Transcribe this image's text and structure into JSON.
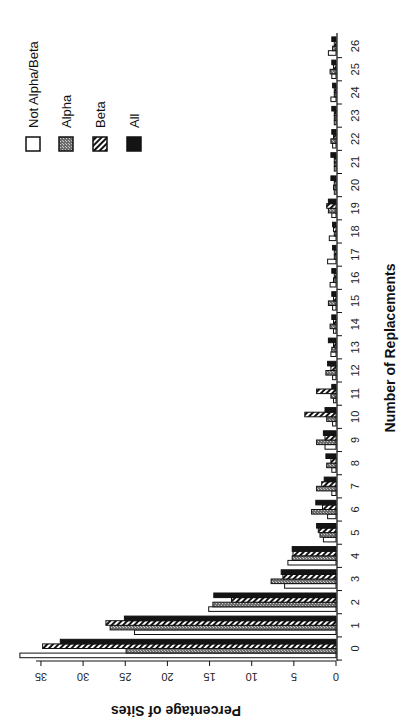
{
  "chart_data": {
    "type": "bar",
    "orientation": "rotated-90-ccw (bars grow leftward in image; x-axis categories run bottom-to-top)",
    "title": "",
    "xlabel": "Number of Replacements",
    "ylabel": "Percentage of Sites",
    "categories": [
      "0",
      "1",
      "2",
      "3",
      "4",
      "5",
      "6",
      "7",
      "8",
      "9",
      "10",
      "11",
      "12",
      "13",
      "14",
      "15",
      "16",
      "17",
      "18",
      "19",
      "20",
      "21",
      "22",
      "23",
      "24",
      "25",
      "26"
    ],
    "y_ticks": [
      0,
      5,
      10,
      15,
      20,
      25,
      30,
      35
    ],
    "ylim": [
      0,
      38
    ],
    "grid": false,
    "legend_position": "top-left (image coords)",
    "series": [
      {
        "name": "Not Alpha/Beta",
        "pattern": "white",
        "values": [
          37.5,
          23.9,
          15.1,
          6.1,
          5.7,
          1.5,
          1.0,
          0.5,
          0.5,
          1.3,
          0.4,
          0.3,
          0.4,
          0.6,
          0.3,
          0.4,
          0.7,
          1.0,
          0.8,
          0.5,
          0.2,
          0.2,
          0.4,
          0.2,
          0.6,
          0.5,
          0.9
        ]
      },
      {
        "name": "Alpha",
        "pattern": "gray",
        "values": [
          24.9,
          26.8,
          14.6,
          7.7,
          5.2,
          1.9,
          2.9,
          2.3,
          1.1,
          2.3,
          1.1,
          0.6,
          1.2,
          0.5,
          0.7,
          0.9,
          0.3,
          0.2,
          0.2,
          0.9,
          0.3,
          0.2,
          0.6,
          0.2,
          0.2,
          0.7,
          0.4
        ]
      },
      {
        "name": "Beta",
        "pattern": "hatched",
        "values": [
          34.8,
          27.3,
          12.4,
          6.3,
          5.1,
          2.1,
          1.6,
          1.7,
          0.6,
          1.3,
          3.7,
          2.3,
          0.6,
          0.3,
          0.3,
          0.3,
          0.2,
          0.2,
          0.3,
          1.1,
          0.2,
          0.2,
          0.3,
          0.2,
          0.2,
          0.3,
          0.2
        ]
      },
      {
        "name": "All",
        "pattern": "black",
        "values": [
          32.7,
          25.1,
          14.5,
          6.5,
          5.2,
          2.3,
          2.4,
          1.4,
          1.2,
          1.5,
          1.3,
          0.5,
          1.0,
          0.9,
          0.5,
          0.5,
          0.5,
          0.4,
          0.4,
          0.9,
          0.6,
          0.6,
          0.5,
          0.5,
          0.4,
          0.5,
          0.5
        ]
      }
    ]
  },
  "legend": {
    "items": [
      {
        "label": "Not  Alpha/Beta",
        "pattern": "white"
      },
      {
        "label": "Alpha",
        "pattern": "gray"
      },
      {
        "label": "Beta",
        "pattern": "hatched"
      },
      {
        "label": "All",
        "pattern": "black"
      }
    ]
  },
  "axes": {
    "x_title": "Number of Replacements",
    "y_title": "Percentage of Sites"
  },
  "colors": {
    "black": "#141414",
    "gray": "#8a8a8a",
    "white": "#ffffff",
    "stroke": "#111111"
  }
}
